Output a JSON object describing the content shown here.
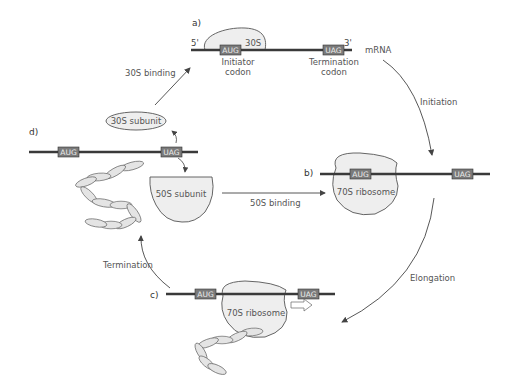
{
  "colors": {
    "mrna": "#3a3a3a",
    "codon_box": "#7a7a7a",
    "subunit_fill": "#e8e8e8",
    "outline": "#555555",
    "arrow": "#444444",
    "text": "#555555"
  },
  "panels": {
    "a": {
      "letter": "a)",
      "five_prime": "5'",
      "three_prime": "3'",
      "subunit_label": "30S",
      "start_codon": "AUG",
      "stop_codon": "UAG",
      "mrna_label": "mRNA",
      "start_caption_1": "Initiator",
      "start_caption_2": "codon",
      "stop_caption_1": "Termination",
      "stop_caption_2": "codon"
    },
    "b": {
      "letter": "b)",
      "start_codon": "AUG",
      "stop_codon": "UAG",
      "ribosome_label": "70S ribosome"
    },
    "c": {
      "letter": "c)",
      "start_codon": "AUG",
      "stop_codon": "UAG",
      "ribosome_label": "70S ribosome"
    },
    "d": {
      "letter": "d)",
      "start_codon": "AUG",
      "stop_codon": "UAG",
      "small_subunit_label": "30S subunit",
      "large_subunit_label": "50S subunit"
    }
  },
  "steps": {
    "binding_30s": "30S binding",
    "initiation": "Initiation",
    "binding_50s": "50S binding",
    "elongation": "Elongation",
    "termination": "Termination"
  }
}
